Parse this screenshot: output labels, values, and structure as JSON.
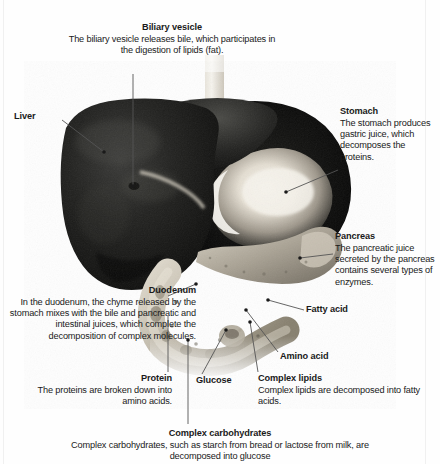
{
  "figure": {
    "kind": "anatomical-illustration",
    "style": "grayscale photographic render on white background",
    "colors": {
      "background": "#fefefe",
      "text": "#1a1a1a",
      "leader_line": "#555555",
      "liver": "#171717",
      "stomach_highlight": "#f2efe8",
      "pancreas": "#b9b2a6",
      "duodenum": "#c9c3b6"
    }
  },
  "labels": {
    "biliary_vesicle": {
      "title": "Biliary vesicle",
      "body": "The biliary vesicle releases bile, which participates in the digestion of lipids (fat)."
    },
    "liver": {
      "title": "Liver",
      "body": ""
    },
    "stomach": {
      "title": "Stomach",
      "body": "The stomach produces gastric juice, which decomposes the proteins."
    },
    "pancreas": {
      "title": "Pancreas",
      "body": "The pancreatic juice secreted by the pancreas contains several types of enzymes."
    },
    "fatty_acid": {
      "title": "Fatty acid",
      "body": ""
    },
    "amino_acid": {
      "title": "Amino acid",
      "body": ""
    },
    "duodenum": {
      "title": "Duodenum",
      "body": "In the duodenum, the chyme released by the stomach mixes with the bile and pancreatic and intestinal juices, which complete the decomposition of complex molecules."
    },
    "protein": {
      "title": "Protein",
      "body": "The proteins are broken down into amino acids."
    },
    "glucose": {
      "title": "Glucose",
      "body": ""
    },
    "complex_lipids": {
      "title": "Complex lipids",
      "body": "Complex lipids are decomposed into fatty acids."
    },
    "complex_carbohydrates": {
      "title": "Complex carbohydrates",
      "body": "Complex carbohydrates, such as starch from bread or lactose from milk, are decomposed into glucose"
    }
  }
}
